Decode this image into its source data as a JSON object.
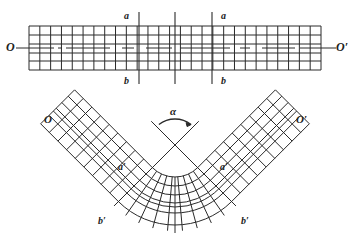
{
  "colors": {
    "stroke": "#2a2a2a",
    "background": "#ffffff"
  },
  "straight_beam": {
    "grid": {
      "x0": 29,
      "x1": 321,
      "y0": 26,
      "y1": 70,
      "cols": 27,
      "row_lines": [
        26,
        35,
        44,
        53,
        61,
        70
      ]
    },
    "axis": {
      "y": 48,
      "x_start": 16,
      "x_end": 336,
      "dash_segments": [
        [
          16,
          54
        ],
        [
          58,
          62
        ],
        [
          66,
          110
        ],
        [
          122,
          134
        ],
        [
          146,
          172
        ],
        [
          180,
          230
        ],
        [
          240,
          250
        ],
        [
          262,
          295
        ],
        [
          300,
          336
        ]
      ]
    },
    "section_lines": [
      {
        "x": 139,
        "y0": 12,
        "y1": 84
      },
      {
        "x": 175,
        "y0": 12,
        "y1": 84
      },
      {
        "x": 212,
        "y0": 12,
        "y1": 84
      }
    ],
    "labels": {
      "O": {
        "text": "O",
        "x": 6,
        "y": 52
      },
      "O_prime": {
        "text": "O′",
        "x": 337,
        "y": 52
      },
      "a_left": {
        "text": "a",
        "x": 124,
        "y": 20
      },
      "b_left": {
        "text": "b",
        "x": 124,
        "y": 85
      },
      "a_right": {
        "text": "a",
        "x": 222,
        "y": 20
      },
      "b_right": {
        "text": "b",
        "x": 222,
        "y": 85
      }
    }
  },
  "bent_beam": {
    "center": {
      "x": 175,
      "y": 145
    },
    "inner_radius": 32,
    "outer_radius": 80,
    "ring_radii": [
      32,
      41,
      50,
      58,
      62,
      68,
      80
    ],
    "half_angle_deg": 45,
    "arc_radial_divisions": 9,
    "arm_length": 110,
    "arm_cells": 9,
    "crossing_lines": {
      "top_extent": 24
    },
    "alpha_arc": {
      "cx": 175,
      "cy": 145,
      "r": 26
    },
    "labels": {
      "O": {
        "text": "O",
        "x": 45,
        "y": 124
      },
      "O_prime": {
        "text": "O′",
        "x": 298,
        "y": 124
      },
      "a_prime_left": {
        "text": "a′",
        "x": 118,
        "y": 172
      },
      "a_prime_right": {
        "text": "a′",
        "x": 222,
        "y": 172
      },
      "b_prime_left": {
        "text": "b′",
        "x": 97,
        "y": 225
      },
      "b_prime_right": {
        "text": "b′",
        "x": 243,
        "y": 225
      },
      "alpha": {
        "text": "α",
        "x": 171,
        "y": 116
      }
    }
  }
}
